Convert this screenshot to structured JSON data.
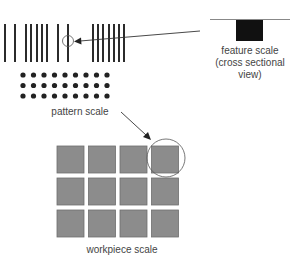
{
  "diagram": {
    "labels": {
      "feature_scale_line1": "feature scale",
      "feature_scale_line2": "(cross sectional",
      "feature_scale_line3": "view)",
      "pattern_scale": "pattern scale",
      "workpiece_scale": "workpiece scale"
    },
    "line_pattern": {
      "x_positions": [
        5,
        15,
        26,
        31,
        37,
        42,
        47,
        58,
        68,
        93,
        98,
        103,
        109,
        114,
        119,
        124
      ],
      "y_top": 24,
      "y_bottom": 62,
      "color": "#2b2b2b"
    },
    "dot_pattern": {
      "columns": 9,
      "rows": 3,
      "color": "#222222"
    },
    "workpiece_grid": {
      "columns": 4,
      "rows": 3,
      "fill": "#8c8c8c",
      "stroke": "#6e6e6e"
    },
    "feature": {
      "fill": "#111111",
      "surface_color": "#888888"
    }
  }
}
